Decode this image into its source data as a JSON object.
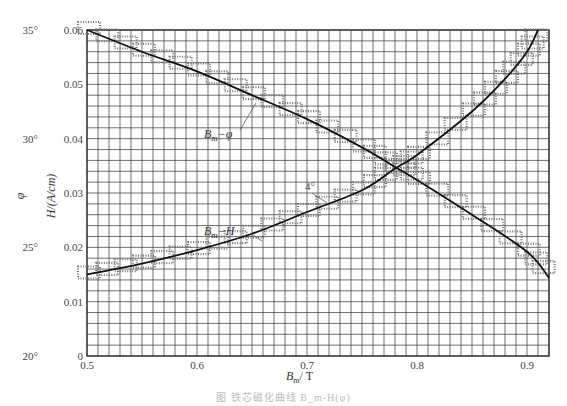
{
  "chart_data": {
    "type": "line",
    "title": "",
    "caption": "图 铁芯磁化曲线 B_m-H(φ)",
    "xlabel": "B_m / T",
    "ylabel_left_inner": "H/(A/cm)",
    "ylabel_left_outer": "φ",
    "xlim": [
      0.5,
      0.92
    ],
    "ylim": [
      0,
      0.06
    ],
    "phi_lim": [
      20,
      35
    ],
    "x_ticks": [
      "0.5",
      "0.6",
      "0.7",
      "0.8",
      "0.9"
    ],
    "y_ticks": [
      "0",
      "0.01",
      "0.02",
      "0.03",
      "0.04",
      "0.05",
      "0.06"
    ],
    "phi_ticks": [
      "20°",
      "25°",
      "30°",
      "35°"
    ],
    "grid": true,
    "series": [
      {
        "name": "B_m-H",
        "x": [
          0.5,
          0.55,
          0.6,
          0.65,
          0.7,
          0.75,
          0.78,
          0.8,
          0.85,
          0.88,
          0.9,
          0.91
        ],
        "values": [
          0.015,
          0.017,
          0.0195,
          0.0225,
          0.0265,
          0.0305,
          0.0345,
          0.037,
          0.045,
          0.051,
          0.056,
          0.06
        ]
      },
      {
        "name": "B_m-φ",
        "x": [
          0.5,
          0.55,
          0.6,
          0.65,
          0.7,
          0.75,
          0.78,
          0.8,
          0.85,
          0.9,
          0.92
        ],
        "values": [
          35,
          34,
          33.1,
          32.0,
          30.9,
          29.6,
          28.7,
          28.1,
          26.5,
          24.8,
          23.6
        ]
      }
    ],
    "annotations": [
      {
        "text": "B_m-φ",
        "target": "phi-curve"
      },
      {
        "text": "B_m-H",
        "target": "h-curve"
      },
      {
        "text": "4°",
        "target": "h-curve"
      }
    ]
  },
  "labels": {
    "x_axis": "B",
    "x_axis_sub": "m",
    "x_axis_unit": "/ T",
    "h_axis": "H/(A/cm)",
    "phi_axis": "φ",
    "ann_phi": "B",
    "ann_phi_sub": "m",
    "ann_phi_rest": "−φ",
    "ann_h": "B",
    "ann_h_sub": "m",
    "ann_h_rest": "−H",
    "ann_deg": "4°",
    "caption": "图 铁芯磁化曲线 B_m-H(φ)"
  }
}
